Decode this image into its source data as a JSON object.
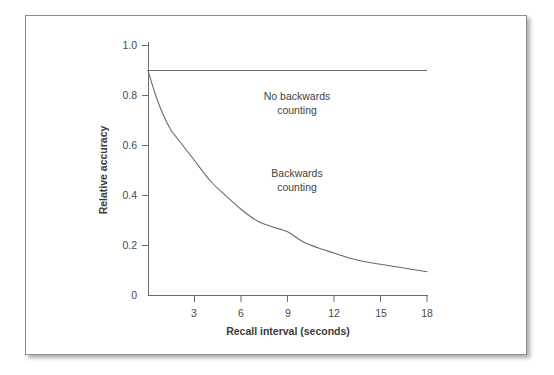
{
  "figure": {
    "frame_color": "#8c8c8c",
    "background": "#ffffff",
    "line_color": "#5a5a5a"
  },
  "chart_data": {
    "type": "line",
    "title": "",
    "xlabel": "Recall interval (seconds)",
    "ylabel": "Relative accuracy",
    "xlim": [
      0,
      18
    ],
    "ylim": [
      0,
      1.0
    ],
    "xticks": [
      3,
      6,
      9,
      12,
      15,
      18
    ],
    "xtick_labels": [
      "3",
      "6",
      "9",
      "12",
      "15",
      "18"
    ],
    "yticks": [
      0,
      0.2,
      0.4,
      0.6,
      0.8,
      1.0
    ],
    "ytick_labels": [
      "0",
      "0.2",
      "0.4",
      "0.6",
      "0.8",
      "1.0"
    ],
    "grid": false,
    "legend": "none",
    "annotations": [
      {
        "text": "No backwards\ncounting",
        "x": 9.6,
        "y": 0.77
      },
      {
        "text": "Backwards\ncounting",
        "x": 9.6,
        "y": 0.46
      }
    ],
    "series": [
      {
        "name": "No backwards counting",
        "style": "solid-horizontal",
        "x": [
          0,
          1,
          2,
          3,
          4,
          5,
          6,
          7,
          8,
          9,
          10,
          11,
          12,
          13,
          14,
          15,
          16,
          17,
          18
        ],
        "values": [
          0.9,
          0.9,
          0.9,
          0.9,
          0.9,
          0.9,
          0.9,
          0.9,
          0.9,
          0.9,
          0.9,
          0.9,
          0.9,
          0.9,
          0.9,
          0.9,
          0.9,
          0.9,
          0.9
        ]
      },
      {
        "name": "Backwards counting",
        "style": "solid-decay",
        "x": [
          0,
          0.5,
          1,
          1.5,
          2,
          3,
          4,
          5,
          6,
          7,
          8,
          9,
          10,
          11,
          12,
          13,
          14,
          15,
          16,
          17,
          18
        ],
        "values": [
          0.9,
          0.8,
          0.72,
          0.66,
          0.62,
          0.54,
          0.46,
          0.4,
          0.345,
          0.3,
          0.275,
          0.255,
          0.215,
          0.19,
          0.17,
          0.15,
          0.135,
          0.125,
          0.115,
          0.105,
          0.095
        ]
      }
    ]
  }
}
